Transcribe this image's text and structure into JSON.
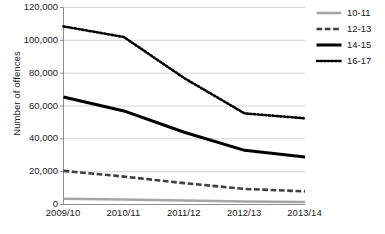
{
  "chart_data": {
    "type": "line",
    "title": "",
    "xlabel": "",
    "ylabel": "Number of offences",
    "categories": [
      "2009/10",
      "2010/11",
      "2011/12",
      "2012/13",
      "2013/14"
    ],
    "ylim": [
      0,
      120000
    ],
    "yticks": [
      0,
      20000,
      40000,
      60000,
      80000,
      100000,
      120000
    ],
    "ytick_labels": [
      "0",
      "20,000",
      "40,000",
      "60,000",
      "80,000",
      "100,000",
      "120,000"
    ],
    "grid": "horizontal",
    "legend_position": "right-top",
    "series": [
      {
        "name": "10-11",
        "values": [
          3500,
          3000,
          2400,
          1800,
          1500
        ],
        "color": "#a6a6a6",
        "style": "solid",
        "width": 2.6
      },
      {
        "name": "12-13",
        "values": [
          20500,
          17000,
          13000,
          9500,
          8000
        ],
        "color": "#3f3f3f",
        "style": "dashed",
        "width": 2.6
      },
      {
        "name": "14-15",
        "values": [
          65500,
          57000,
          44000,
          33000,
          29000
        ],
        "color": "#000000",
        "style": "solid",
        "width": 3.0
      },
      {
        "name": "16-17",
        "values": [
          108500,
          102000,
          77000,
          55500,
          52500
        ],
        "color": "#000000",
        "style": "dotted",
        "width": 2.6
      }
    ]
  },
  "legend": {
    "items": [
      {
        "label": "10-11"
      },
      {
        "label": "12-13"
      },
      {
        "label": "14-15"
      },
      {
        "label": "16-17"
      }
    ]
  },
  "axes": {
    "y_title": "Number of offences"
  }
}
